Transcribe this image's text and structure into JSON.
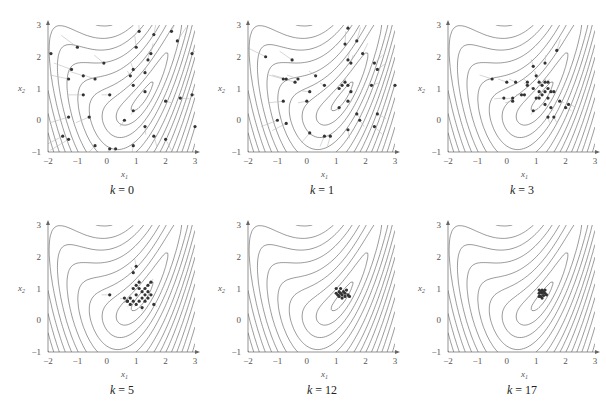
{
  "chart_data": [
    {
      "type": "scatter",
      "title": "k = 0",
      "caption_k": "k",
      "caption_val": "0",
      "xlabel": "x1",
      "ylabel": "x2",
      "xlim": [
        -2,
        3
      ],
      "ylim": [
        -1,
        3
      ],
      "xticks": [
        "-2",
        "-1",
        "0",
        "1",
        "2",
        "3"
      ],
      "yticks": [
        "-1",
        "0",
        "1",
        "2",
        "3"
      ],
      "background": "contour",
      "points": [
        [
          -1.9,
          2.1
        ],
        [
          -1.0,
          2.3
        ],
        [
          -1.2,
          1.6
        ],
        [
          -1.3,
          1.3
        ],
        [
          -0.8,
          1.4
        ],
        [
          -0.4,
          1.3
        ],
        [
          -0.1,
          1.8
        ],
        [
          -0.8,
          0.8
        ],
        [
          -1.3,
          0.1
        ],
        [
          -0.6,
          0.1
        ],
        [
          -1.5,
          -0.5
        ],
        [
          -1.3,
          -0.6
        ],
        [
          -0.4,
          -0.8
        ],
        [
          0.1,
          -0.9
        ],
        [
          0.3,
          -0.9
        ],
        [
          0.1,
          0.8
        ],
        [
          0.6,
          0.0
        ],
        [
          0.9,
          0.3
        ],
        [
          0.9,
          1.1
        ],
        [
          0.8,
          1.4
        ],
        [
          0.9,
          1.6
        ],
        [
          1.0,
          2.3
        ],
        [
          1.3,
          1.5
        ],
        [
          1.4,
          1.9
        ],
        [
          1.5,
          2.1
        ],
        [
          1.3,
          0.9
        ],
        [
          1.1,
          2.8
        ],
        [
          1.6,
          2.7
        ],
        [
          2.2,
          2.8
        ],
        [
          2.4,
          2.5
        ],
        [
          2.9,
          2.1
        ],
        [
          2.0,
          0.6
        ],
        [
          2.5,
          0.7
        ],
        [
          2.9,
          0.8
        ],
        [
          1.3,
          -0.2
        ],
        [
          1.6,
          -0.5
        ],
        [
          0.9,
          -0.8
        ],
        [
          2.0,
          -0.6
        ],
        [
          3.0,
          -0.2
        ]
      ]
    },
    {
      "type": "scatter",
      "title": "k = 1",
      "caption_k": "k",
      "caption_val": "1",
      "xlabel": "x1",
      "ylabel": "x2",
      "xlim": [
        -2,
        3
      ],
      "ylim": [
        -1,
        3
      ],
      "xticks": [
        "-2",
        "-1",
        "0",
        "1",
        "2",
        "3"
      ],
      "yticks": [
        "-1",
        "0",
        "1",
        "2",
        "3"
      ],
      "background": "contour",
      "points": [
        [
          -1.4,
          2.0
        ],
        [
          -0.5,
          1.9
        ],
        [
          -0.8,
          1.3
        ],
        [
          -0.7,
          1.3
        ],
        [
          -0.4,
          1.2
        ],
        [
          -0.3,
          1.3
        ],
        [
          0.3,
          1.4
        ],
        [
          0.6,
          1.1
        ],
        [
          0.1,
          0.9
        ],
        [
          0.0,
          0.6
        ],
        [
          -0.8,
          0.6
        ],
        [
          -1.0,
          0.0
        ],
        [
          -0.7,
          -0.1
        ],
        [
          0.1,
          -0.4
        ],
        [
          0.6,
          -0.5
        ],
        [
          0.8,
          -0.5
        ],
        [
          1.1,
          1.0
        ],
        [
          1.2,
          1.1
        ],
        [
          1.3,
          1.2
        ],
        [
          1.4,
          1.1
        ],
        [
          1.5,
          0.9
        ],
        [
          1.4,
          0.6
        ],
        [
          1.1,
          0.4
        ],
        [
          1.4,
          1.9
        ],
        [
          1.5,
          1.8
        ],
        [
          1.7,
          2.5
        ],
        [
          1.3,
          2.4
        ],
        [
          1.4,
          2.9
        ],
        [
          1.9,
          2.1
        ],
        [
          2.3,
          1.8
        ],
        [
          2.4,
          1.6
        ],
        [
          2.2,
          1.1
        ],
        [
          1.7,
          0.2
        ],
        [
          1.8,
          0.0
        ],
        [
          2.4,
          0.2
        ],
        [
          2.3,
          -0.2
        ],
        [
          1.4,
          -0.3
        ],
        [
          3.0,
          1.1
        ]
      ]
    },
    {
      "type": "scatter",
      "title": "k = 3",
      "caption_k": "k",
      "caption_val": "3",
      "xlabel": "x1",
      "ylabel": "x2",
      "xlim": [
        -2,
        3
      ],
      "ylim": [
        -1,
        3
      ],
      "xticks": [
        "-2",
        "-1",
        "0",
        "1",
        "2",
        "3"
      ],
      "yticks": [
        "-1",
        "0",
        "1",
        "2",
        "3"
      ],
      "background": "contour",
      "points": [
        [
          -0.5,
          1.3
        ],
        [
          0.0,
          1.2
        ],
        [
          0.3,
          1.2
        ],
        [
          -0.1,
          0.7
        ],
        [
          0.2,
          0.6
        ],
        [
          0.2,
          0.7
        ],
        [
          0.5,
          0.8
        ],
        [
          0.6,
          0.8
        ],
        [
          0.7,
          1.2
        ],
        [
          0.7,
          1.1
        ],
        [
          0.9,
          1.7
        ],
        [
          0.9,
          1.0
        ],
        [
          1.0,
          1.4
        ],
        [
          1.1,
          1.2
        ],
        [
          1.2,
          1.1
        ],
        [
          1.3,
          1.2
        ],
        [
          1.4,
          1.2
        ],
        [
          1.4,
          1.0
        ],
        [
          1.5,
          0.9
        ],
        [
          1.6,
          0.9
        ],
        [
          1.0,
          0.7
        ],
        [
          1.1,
          0.7
        ],
        [
          1.2,
          0.8
        ],
        [
          1.4,
          0.7
        ],
        [
          1.3,
          0.5
        ],
        [
          1.5,
          0.4
        ],
        [
          0.9,
          0.3
        ],
        [
          1.4,
          0.1
        ],
        [
          1.6,
          0.1
        ],
        [
          1.8,
          0.6
        ],
        [
          2.0,
          0.4
        ],
        [
          2.1,
          0.5
        ],
        [
          1.3,
          1.8
        ],
        [
          1.7,
          2.2
        ],
        [
          1.1,
          0.9
        ],
        [
          1.3,
          0.9
        ]
      ]
    },
    {
      "type": "scatter",
      "title": "k = 5",
      "caption_k": "k",
      "caption_val": "5",
      "xlabel": "x1",
      "ylabel": "x2",
      "xlim": [
        -2,
        3
      ],
      "ylim": [
        -1,
        3
      ],
      "xticks": [
        "-2",
        "-1",
        "0",
        "1",
        "2",
        "3"
      ],
      "yticks": [
        "-1",
        "0",
        "1",
        "2",
        "3"
      ],
      "background": "contour",
      "points": [
        [
          0.1,
          0.8
        ],
        [
          0.6,
          0.7
        ],
        [
          0.7,
          0.6
        ],
        [
          0.8,
          0.5
        ],
        [
          0.8,
          0.7
        ],
        [
          0.9,
          0.6
        ],
        [
          0.9,
          1.0
        ],
        [
          1.0,
          1.1
        ],
        [
          1.0,
          0.8
        ],
        [
          1.1,
          1.0
        ],
        [
          1.1,
          1.2
        ],
        [
          1.2,
          0.9
        ],
        [
          1.2,
          0.7
        ],
        [
          1.3,
          1.0
        ],
        [
          1.3,
          0.8
        ],
        [
          1.4,
          1.1
        ],
        [
          1.4,
          0.9
        ],
        [
          1.5,
          1.2
        ],
        [
          1.5,
          0.8
        ],
        [
          1.6,
          0.5
        ],
        [
          1.2,
          0.4
        ],
        [
          1.0,
          0.5
        ],
        [
          0.9,
          1.5
        ],
        [
          1.0,
          1.7
        ],
        [
          1.3,
          0.6
        ],
        [
          1.1,
          0.6
        ],
        [
          0.7,
          0.6
        ],
        [
          1.4,
          0.7
        ]
      ]
    },
    {
      "type": "scatter",
      "title": "k = 12",
      "caption_k": "k",
      "caption_val": "12",
      "xlabel": "x1",
      "ylabel": "x2",
      "xlim": [
        -2,
        3
      ],
      "ylim": [
        -1,
        3
      ],
      "xticks": [
        "-2",
        "-1",
        "0",
        "1",
        "2",
        "3"
      ],
      "yticks": [
        "-1",
        "0",
        "1",
        "2",
        "3"
      ],
      "background": "contour",
      "points": [
        [
          1.0,
          1.0
        ],
        [
          1.1,
          0.9
        ],
        [
          1.05,
          0.8
        ],
        [
          1.15,
          0.85
        ],
        [
          1.2,
          0.8
        ],
        [
          1.25,
          0.9
        ],
        [
          1.3,
          0.85
        ],
        [
          1.35,
          0.95
        ],
        [
          1.4,
          0.8
        ],
        [
          1.2,
          0.7
        ],
        [
          1.1,
          0.75
        ],
        [
          1.3,
          0.75
        ],
        [
          1.45,
          0.75
        ],
        [
          1.0,
          0.85
        ],
        [
          1.15,
          1.0
        ]
      ]
    },
    {
      "type": "scatter",
      "title": "k = 17",
      "caption_k": "k",
      "caption_val": "17",
      "xlabel": "x1",
      "ylabel": "x2",
      "xlim": [
        -2,
        3
      ],
      "ylim": [
        -1,
        3
      ],
      "xticks": [
        "-2",
        "-1",
        "0",
        "1",
        "2",
        "3"
      ],
      "yticks": [
        "-1",
        "0",
        "1",
        "2",
        "3"
      ],
      "background": "contour",
      "points": [
        [
          1.1,
          0.95
        ],
        [
          1.15,
          0.9
        ],
        [
          1.2,
          0.95
        ],
        [
          1.25,
          0.9
        ],
        [
          1.3,
          0.95
        ],
        [
          1.1,
          0.85
        ],
        [
          1.2,
          0.85
        ],
        [
          1.3,
          0.85
        ],
        [
          1.15,
          0.75
        ],
        [
          1.25,
          0.78
        ],
        [
          1.35,
          0.8
        ],
        [
          1.2,
          0.7
        ],
        [
          1.1,
          0.75
        ]
      ]
    }
  ]
}
